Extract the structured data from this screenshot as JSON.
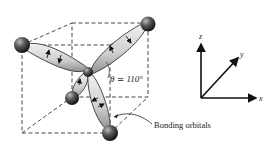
{
  "figure": {
    "angle_label": "θ ≃ 110°",
    "annotation": "Bonding orbitals",
    "axes": {
      "z": "z",
      "y": "y",
      "x": "x"
    }
  },
  "colors": {
    "line": "#222222",
    "orbital_fill": "#d8d8d8",
    "sphere_dark": "#1e1e1e",
    "sphere_light": "#9a9a9a"
  }
}
